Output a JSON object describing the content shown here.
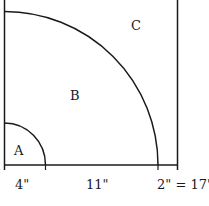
{
  "diagram": {
    "type": "quarter-circle-regions",
    "regions": [
      {
        "id": "A",
        "label": "A"
      },
      {
        "id": "B",
        "label": "B"
      },
      {
        "id": "C",
        "label": "C"
      }
    ],
    "measurements": [
      {
        "label": "4\""
      },
      {
        "label": "11\""
      },
      {
        "label": "2\" = 17\""
      }
    ],
    "colors": {
      "line": "#1a1a1a",
      "background": "#ffffff"
    }
  }
}
